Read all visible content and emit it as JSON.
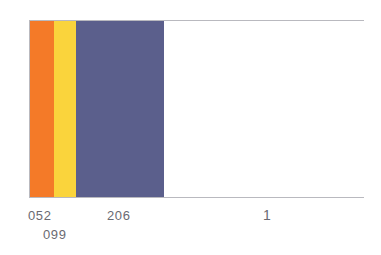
{
  "chart_data": {
    "type": "bar",
    "title": "",
    "subtitle": "",
    "xlabel": "",
    "ylabel": "",
    "grid": false,
    "legend": "none",
    "orientation": "horizontal-stacked",
    "xlim": [
      0,
      335
    ],
    "categories": [
      "052",
      "099",
      "206",
      "1"
    ],
    "values": [
      24,
      22,
      88,
      0
    ],
    "series": [
      {
        "name": "color-bands",
        "values": [
          24,
          22,
          88,
          201
        ]
      }
    ],
    "tick_labels": [
      "052",
      "099",
      "206",
      "1"
    ],
    "annotations": [
      {
        "text": "052",
        "x": 28,
        "y": 209
      },
      {
        "text": "099",
        "x": 43,
        "y": 228
      },
      {
        "text": "206",
        "x": 107,
        "y": 209
      },
      {
        "text": "1",
        "x": 263,
        "y": 208
      }
    ],
    "bands": [
      {
        "label": "052",
        "color": "#f47a28",
        "x_start": 0,
        "x_end": 24,
        "width": 24
      },
      {
        "label": "099",
        "color": "#fad43c",
        "x_start": 24,
        "x_end": 46,
        "width": 22
      },
      {
        "label": "206",
        "color": "#5b5f8c",
        "x_start": 46,
        "x_end": 134,
        "width": 88
      },
      {
        "label": "1",
        "color": "#ffffff",
        "x_start": 134,
        "x_end": 335,
        "width": 201
      }
    ]
  },
  "figure": {
    "frame_color": "#b9b9bf",
    "background": "#ffffff",
    "text_color": "#6a6a72"
  }
}
